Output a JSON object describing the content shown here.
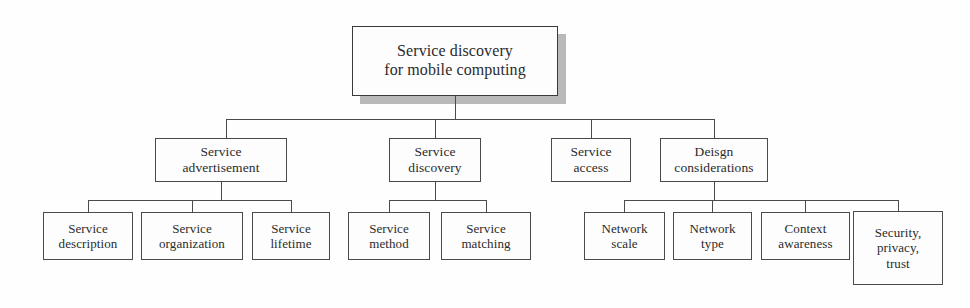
{
  "diagram": {
    "type": "hierarchy-tree",
    "title": "Service discovery for mobile computing",
    "orientation": "top-down",
    "levels": 3,
    "colors": {
      "background": "#fefefe",
      "node_fill": "#fdfdfd",
      "node_border": "#4a4a4a",
      "text": "#2b2b2b",
      "shadow": "#b9b9b9",
      "connector": "#4a4a4a"
    },
    "root": {
      "id": "root",
      "label": "Service discovery\nfor mobile computing",
      "has_shadow": true,
      "x": 352,
      "y": 26,
      "w": 206,
      "h": 70
    },
    "level1": [
      {
        "id": "service-advertisement",
        "label": "Service\nadvertisement",
        "x": 155,
        "y": 138,
        "w": 132,
        "h": 44
      },
      {
        "id": "service-discovery",
        "label": "Service\ndiscovery",
        "x": 389,
        "y": 138,
        "w": 92,
        "h": 44
      },
      {
        "id": "service-access",
        "label": "Service\naccess",
        "x": 551,
        "y": 138,
        "w": 80,
        "h": 44
      },
      {
        "id": "deisgn-considerations",
        "label": "Deisgn\nconsiderations",
        "x": 660,
        "y": 138,
        "w": 108,
        "h": 44
      }
    ],
    "level2": [
      {
        "id": "service-description",
        "parent": "service-advertisement",
        "label": "Service\ndescription",
        "x": 43,
        "y": 212,
        "w": 90,
        "h": 48
      },
      {
        "id": "service-organization",
        "parent": "service-advertisement",
        "label": "Service\norganization",
        "x": 141,
        "y": 212,
        "w": 102,
        "h": 48
      },
      {
        "id": "service-lifetime",
        "parent": "service-advertisement",
        "label": "Service\nlifetime",
        "x": 252,
        "y": 212,
        "w": 78,
        "h": 48
      },
      {
        "id": "service-method",
        "parent": "service-discovery",
        "label": "Service\nmethod",
        "x": 348,
        "y": 212,
        "w": 82,
        "h": 48
      },
      {
        "id": "service-matching",
        "parent": "service-discovery",
        "label": "Service\nmatching",
        "x": 441,
        "y": 212,
        "w": 90,
        "h": 48
      },
      {
        "id": "network-scale",
        "parent": "deisgn-considerations",
        "label": "Network\nscale",
        "x": 584,
        "y": 212,
        "w": 81,
        "h": 48
      },
      {
        "id": "network-type",
        "parent": "deisgn-considerations",
        "label": "Network\ntype",
        "x": 673,
        "y": 212,
        "w": 79,
        "h": 48
      },
      {
        "id": "context-awareness",
        "parent": "deisgn-considerations",
        "label": "Context\nawareness",
        "x": 761,
        "y": 212,
        "w": 89,
        "h": 48
      },
      {
        "id": "security-privacy-trust",
        "parent": "deisgn-considerations",
        "label": "Security,\nprivacy,\ntrust",
        "x": 853,
        "y": 211,
        "w": 90,
        "h": 74
      }
    ],
    "connectors": {
      "root_stem": {
        "x": 455,
        "y": 96,
        "h": 23
      },
      "main_bus": {
        "x": 226,
        "y": 119,
        "w": 488
      },
      "main_drops": [
        {
          "x": 226,
          "y": 119,
          "h": 19
        },
        {
          "x": 435,
          "y": 119,
          "h": 19
        },
        {
          "x": 591,
          "y": 119,
          "h": 19
        },
        {
          "x": 714,
          "y": 119,
          "h": 19
        }
      ],
      "sub_groups": [
        {
          "parent": "service-advertisement",
          "stem": {
            "x": 221,
            "y": 182,
            "h": 18
          },
          "bus": {
            "x": 88,
            "y": 200,
            "w": 203
          },
          "drops": [
            {
              "x": 88,
              "y": 200,
              "h": 12
            },
            {
              "x": 192,
              "y": 200,
              "h": 12
            },
            {
              "x": 291,
              "y": 200,
              "h": 12
            }
          ]
        },
        {
          "parent": "service-discovery",
          "stem": {
            "x": 435,
            "y": 182,
            "h": 18
          },
          "bus": {
            "x": 389,
            "y": 200,
            "w": 97
          },
          "drops": [
            {
              "x": 389,
              "y": 200,
              "h": 12
            },
            {
              "x": 486,
              "y": 200,
              "h": 12
            }
          ]
        },
        {
          "parent": "deisgn-considerations",
          "stem": {
            "x": 714,
            "y": 182,
            "h": 18
          },
          "bus": {
            "x": 624,
            "y": 200,
            "w": 274
          },
          "drops": [
            {
              "x": 624,
              "y": 200,
              "h": 12
            },
            {
              "x": 712,
              "y": 200,
              "h": 12
            },
            {
              "x": 805,
              "y": 200,
              "h": 12
            },
            {
              "x": 898,
              "y": 200,
              "h": 11
            }
          ]
        }
      ]
    }
  }
}
